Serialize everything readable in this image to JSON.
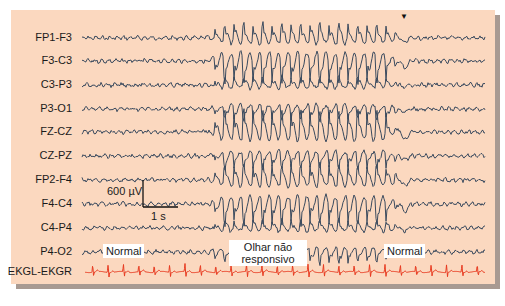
{
  "figure": {
    "background_color": "#fbd8bf",
    "trace_color": "#3a4a5e",
    "ecg_color": "#e83a20",
    "seizure_marker": "▼"
  },
  "channels": [
    {
      "label": "FP1-F3",
      "y": 38,
      "amp": 9
    },
    {
      "label": "F3-C3",
      "y": 61,
      "amp": 14
    },
    {
      "label": "C3-P3",
      "y": 85,
      "amp": 5
    },
    {
      "label": "P3-O1",
      "y": 109,
      "amp": 7
    },
    {
      "label": "FZ-CZ",
      "y": 132,
      "amp": 14
    },
    {
      "label": "CZ-PZ",
      "y": 156,
      "amp": 8
    },
    {
      "label": "FP2-F4",
      "y": 180,
      "amp": 10
    },
    {
      "label": "F4-C4",
      "y": 204,
      "amp": 13
    },
    {
      "label": "C4-P4",
      "y": 228,
      "amp": 5
    },
    {
      "label": "P4-O2",
      "y": 252,
      "amp": 7
    }
  ],
  "ecg": {
    "label": "EKGL-EKGR",
    "y": 272,
    "beats": 26
  },
  "calibration": {
    "amplitude_label": "600 µV",
    "time_label": "1 s"
  },
  "annotations": {
    "normal_before": "Normal",
    "seizure": "Olhar não responsivo",
    "normal_after": "Normal"
  },
  "seizure_window": {
    "start_x": 205,
    "end_x": 400
  }
}
